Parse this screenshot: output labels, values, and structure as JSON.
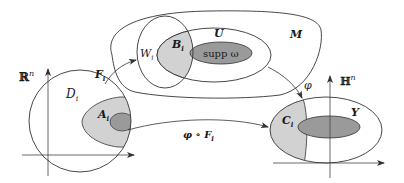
{
  "diagram": {
    "colors": {
      "stroke": "#333333",
      "light_shade": "#d2d2d2",
      "dark_shade": "#9a9a9a",
      "background": "#ffffff"
    },
    "left_space": {
      "space_label": "ℝ",
      "space_sup": "n",
      "disk_label": "D",
      "disk_sub": "i",
      "region_label": "A",
      "region_sub": "i"
    },
    "manifold": {
      "label": "M",
      "open_set_label": "U",
      "chart_domain_label": "W",
      "chart_domain_sub": "i",
      "intersection_label": "B",
      "intersection_sub": "i",
      "support_label": "supp ω"
    },
    "right_space": {
      "space_label": "ℍ",
      "space_sup": "n",
      "region_label": "C",
      "region_sub": "i",
      "image_label": "Y"
    },
    "maps": {
      "chart_map": "F",
      "chart_map_sub": "i",
      "phi": "φ",
      "composite": "φ ∘ F",
      "composite_sub": "i"
    }
  }
}
